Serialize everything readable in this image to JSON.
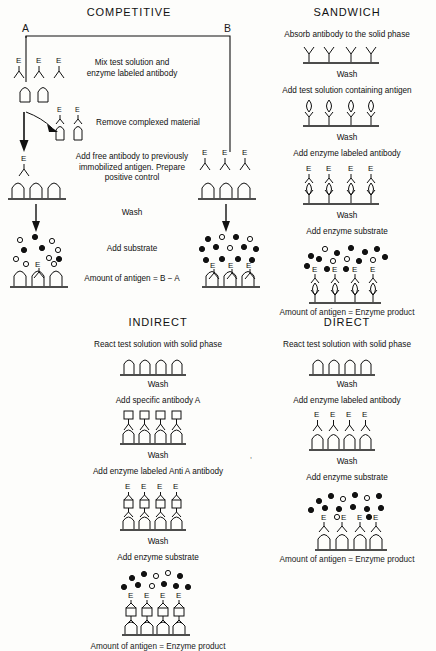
{
  "figure": {
    "type": "elisa-assay-diagram",
    "panels": [
      {
        "id": "competitive",
        "title": "COMPETITIVE",
        "column_labels": {
          "left": "A",
          "right": "B"
        },
        "steps": [
          "Mix test solution and\nenzyme labeled antibody",
          "Remove complexed material",
          "Add free antibody to previously\nimmobilized antigen. Prepare\npositive control",
          "Wash",
          "Add  substrate",
          "Amount of antigen = B − A"
        ]
      },
      {
        "id": "sandwich",
        "title": "SANDWICH",
        "steps": [
          "Absorb antibody to the solid phase",
          "Wash",
          "Add test solution containing antigen",
          "Wash",
          "Add enzyme labeled antibody",
          "Wash",
          "Add enzyme substrate",
          "Amount of antigen = Enzyme  product"
        ]
      },
      {
        "id": "indirect",
        "title": "INDIRECT",
        "steps": [
          "React test solution with solid phase",
          "Wash",
          "Add  specific antibody A",
          "Wash",
          "Add enzyme labeled Anti A antibody",
          "Wash",
          "Add enzyme substrate",
          "Amount of antigen = Enzyme  product"
        ]
      },
      {
        "id": "direct",
        "title": "DIRECT",
        "steps": [
          "React test solution with solid phase",
          "Wash",
          "Add enzyme labeled antibody",
          "Wash",
          "Add  enzyme substrate",
          "Amount of antigen = Enzyme product"
        ]
      }
    ],
    "symbols": {
      "enzyme_label": "E",
      "antibody": "y-shaped-antibody",
      "antigen_arch": "arch-shaped-antigen",
      "antigen_diamond": "diamond-shaped-antigen",
      "antibody_a": "square-topped-antibody",
      "substrate_open": "open-circle",
      "product_filled": "filled-circle",
      "solid_phase": "baseline"
    },
    "colors": {
      "ink": "#111111",
      "background": "#fdfdfb"
    }
  }
}
